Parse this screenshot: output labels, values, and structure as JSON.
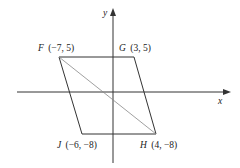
{
  "axes": {
    "x_label": "x",
    "y_label": "y"
  },
  "points": {
    "F": {
      "name": "F",
      "coords": "(−7, 5)"
    },
    "G": {
      "name": "G",
      "coords": "(3, 5)"
    },
    "H": {
      "name": "H",
      "coords": "(4, −8)"
    },
    "J": {
      "name": "J",
      "coords": "(−6, −8)"
    }
  },
  "shape": {
    "type": "parallelogram",
    "vertices": [
      "F",
      "G",
      "H",
      "J"
    ],
    "diagonal": [
      "F",
      "H"
    ]
  }
}
